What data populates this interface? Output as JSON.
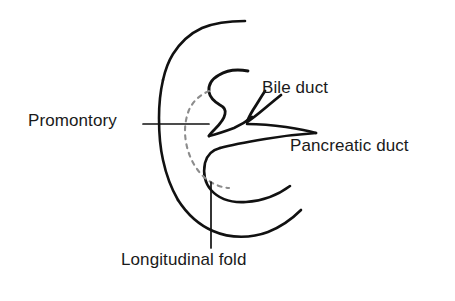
{
  "figure": {
    "background_color": "#ffffff",
    "stroke_color": "#111111",
    "dashed_stroke_color": "#8c8c8c",
    "leader_color": "#111111",
    "text_color": "#1a1a1a",
    "width": 455,
    "height": 301
  },
  "labels": {
    "promontory": "Promontory",
    "bile_duct": "Bile duct",
    "pancreatic_duct": "Pancreatic duct",
    "longitudinal_fold": "Longitudinal fold"
  },
  "structures": [
    {
      "name": "duodenal-wall-upper",
      "description": "Upper curved duodenal wall arcing from upper right down to the left",
      "style": "solid"
    },
    {
      "name": "duodenal-wall-left",
      "description": "Left convex duodenal wall forming the rounded left border",
      "style": "solid"
    },
    {
      "name": "duodenal-wall-lower",
      "description": "Lower duodenal wall arcing from lower left to the right",
      "style": "solid"
    },
    {
      "name": "papilla-outline",
      "description": "Major duodenal papilla projecting into the lumen",
      "style": "solid"
    },
    {
      "name": "bile-duct-channel",
      "description": "Bile duct entering the papilla from upper right",
      "style": "solid"
    },
    {
      "name": "pancreatic-duct-channel",
      "description": "Pancreatic duct entering the papilla from the right",
      "style": "solid"
    },
    {
      "name": "longitudinal-fold-dashed",
      "description": "Dashed outline marking the longitudinal fold beneath the mucosa",
      "style": "dashed"
    }
  ],
  "leader_lines": [
    {
      "name": "promontory-leader",
      "from_label": "Promontory",
      "orientation": "horizontal"
    },
    {
      "name": "longitudinal-fold-leader",
      "from_label": "Longitudinal fold",
      "orientation": "vertical"
    }
  ]
}
